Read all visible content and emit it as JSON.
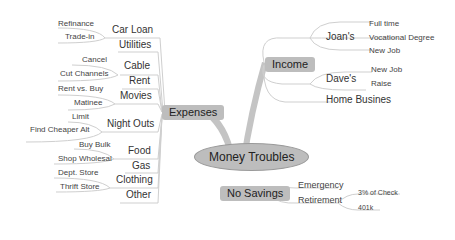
{
  "root": {
    "label": "Money Troubles"
  },
  "branches": {
    "expenses": {
      "label": "Expenses",
      "children": [
        {
          "label": "Car Loan",
          "children": [
            "Refinance",
            "Trade-in"
          ]
        },
        {
          "label": "Utilities",
          "children": []
        },
        {
          "label": "Cable",
          "children": [
            "Cancel",
            "Cut Channels"
          ]
        },
        {
          "label": "Rent",
          "children": []
        },
        {
          "label": "Movies",
          "children": [
            "Rent vs. Buy",
            "Matinee"
          ]
        },
        {
          "label": "Night Outs",
          "children": [
            "Limit",
            "Find Cheaper Alt"
          ]
        },
        {
          "label": "Food",
          "children": [
            "Buy Bulk",
            "Shop Wholesal"
          ]
        },
        {
          "label": "Gas",
          "children": []
        },
        {
          "label": "Clothing",
          "children": [
            "Dept. Store",
            "Thrift Store"
          ]
        },
        {
          "label": "Other",
          "children": []
        }
      ]
    },
    "income": {
      "label": "Income",
      "children": [
        {
          "label": "Joan's",
          "children": [
            "Full time",
            "Vocational Degree",
            "New Job"
          ]
        },
        {
          "label": "Dave's",
          "children": [
            "New Job",
            "Raise"
          ]
        },
        {
          "label": "Home Busines",
          "children": []
        }
      ]
    },
    "no_savings": {
      "label": "No Savings",
      "children": [
        {
          "label": "Emergency",
          "children": []
        },
        {
          "label": "Retirement",
          "children": [
            "3% of Check",
            "401k"
          ]
        }
      ]
    }
  },
  "colors": {
    "node_fill": "#bdbdbd",
    "link": "#c8c8c8",
    "background": "#ffffff"
  }
}
